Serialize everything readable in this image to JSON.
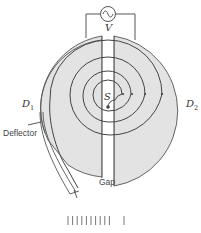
{
  "diagram": {
    "labels": {
      "voltage": "V",
      "source": "S",
      "dee1_main": "D",
      "dee1_sub": "1",
      "dee2_main": "D",
      "dee2_sub": "2",
      "deflector": "Deflector",
      "gap": "Gap"
    },
    "components": [
      {
        "id": "ac-source",
        "symbol": "~"
      },
      {
        "id": "dee-1"
      },
      {
        "id": "dee-2"
      },
      {
        "id": "ion-source"
      },
      {
        "id": "spiral-path",
        "turns": 4
      },
      {
        "id": "deflector"
      },
      {
        "id": "gap"
      }
    ],
    "colors": {
      "dee_fill": "#e3e3e3",
      "stroke": "#555555",
      "background": "#ffffff"
    },
    "bottom_tick_count": 11
  }
}
